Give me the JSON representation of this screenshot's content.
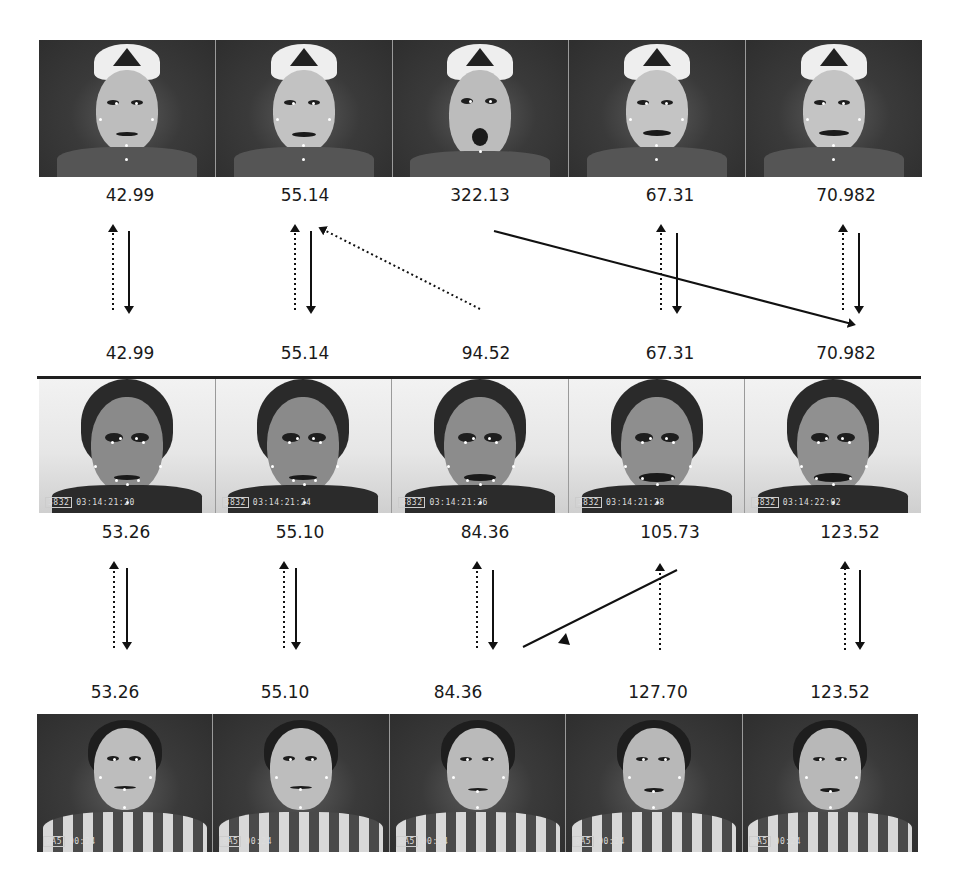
{
  "figure": {
    "rows": [
      {
        "subject": "male-with-cap",
        "frames": 5,
        "timestamps": [
          "",
          "",
          "",
          "",
          ""
        ],
        "labels_below": [
          "42.99",
          "55.14",
          "322.13",
          "67.31",
          "70.982"
        ]
      },
      {
        "subject": "female-smiling",
        "frames": 5,
        "labels_above": [
          "42.99",
          "55.14",
          "94.52",
          "67.31",
          "70.982"
        ],
        "timestamps": [
          "03:14:21:20",
          "03:14:21:24",
          "03:14:21:26",
          "03:14:21:28",
          "03:14:22:02"
        ],
        "labels_below": [
          "53.26",
          "55.10",
          "84.36",
          "105.73",
          "123.52"
        ]
      },
      {
        "subject": "female-frowning",
        "frames": 5,
        "labels_above": [
          "53.26",
          "55.10",
          "84.36",
          "127.70",
          "123.52"
        ],
        "timestamps": [
          "00:24",
          "00:24",
          "00:24",
          "00:24",
          "00:24"
        ]
      }
    ],
    "arrows": {
      "row1_to_row2": [
        {
          "col": 0,
          "type": "bidirectional-vertical"
        },
        {
          "col": 1,
          "type": "bidirectional-vertical"
        },
        {
          "col": 2,
          "type": "dotted-diagonal-to-col1",
          "note": "94.52 maps up to 55.14"
        },
        {
          "col": 2,
          "type": "solid-diagonal-to-col4",
          "note": "322.13 maps down to 70.982"
        },
        {
          "col": 3,
          "type": "bidirectional-vertical"
        },
        {
          "col": 4,
          "type": "bidirectional-vertical"
        }
      ],
      "row2_to_row3": [
        {
          "col": 0,
          "type": "bidirectional-vertical"
        },
        {
          "col": 1,
          "type": "bidirectional-vertical"
        },
        {
          "col": 2,
          "type": "bidirectional-vertical"
        },
        {
          "col": 3,
          "type": "dotted-vertical-up",
          "note": "127.70 maps up to 105.73"
        },
        {
          "col": 3,
          "type": "solid-diagonal-to-col2",
          "note": "105.73 line toward 84.36"
        },
        {
          "col": 4,
          "type": "bidirectional-vertical"
        }
      ]
    }
  }
}
